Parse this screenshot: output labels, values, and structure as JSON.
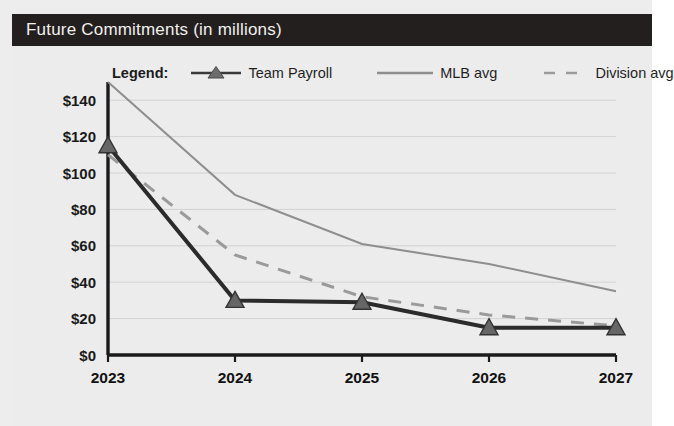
{
  "header": {
    "title": "Future Commitments (in millions)",
    "bar_color": "#231f1e",
    "text_color": "#f2f0ee"
  },
  "panel": {
    "background": "#ececec"
  },
  "legend": {
    "title": "Legend:",
    "entries": [
      {
        "label": "Team Payroll",
        "style": "solid-marker",
        "marker": "triangle",
        "color": "#2b2b2b"
      },
      {
        "label": "MLB avg",
        "style": "solid",
        "marker": "none",
        "color": "#8e8e8e"
      },
      {
        "label": "Division avg",
        "style": "dashed",
        "marker": "none",
        "color": "#9a9a9a"
      }
    ]
  },
  "chart_data": {
    "type": "line",
    "title": "Future Commitments (in millions)",
    "xlabel": "",
    "ylabel": "",
    "categories": [
      "2023",
      "2024",
      "2025",
      "2026",
      "2027"
    ],
    "x": [
      2023,
      2024,
      2025,
      2026,
      2027
    ],
    "series": [
      {
        "name": "Team Payroll",
        "values": [
          115,
          30,
          29,
          15,
          15
        ],
        "color": "#2b2b2b",
        "line_style": "solid",
        "line_width": 4,
        "marker": "triangle"
      },
      {
        "name": "MLB avg",
        "values": [
          150,
          88,
          61,
          50,
          35
        ],
        "color": "#8e8e8e",
        "line_style": "solid",
        "line_width": 2,
        "marker": "none"
      },
      {
        "name": "Division avg",
        "values": [
          110,
          55,
          32,
          22,
          16
        ],
        "color": "#9a9a9a",
        "line_style": "dashed",
        "line_width": 3,
        "marker": "none"
      }
    ],
    "ylim": [
      0,
      150
    ],
    "yticks": [
      0,
      20,
      40,
      60,
      80,
      100,
      120,
      140
    ],
    "ytick_labels": [
      "$0",
      "$20",
      "$40",
      "$60",
      "$80",
      "$100",
      "$120",
      "$140"
    ],
    "grid": true,
    "grid_color": "#d2d2d2",
    "legend_position": "top"
  },
  "axes": {
    "y_tick_labels": [
      "$140",
      "$120",
      "$100",
      "$80",
      "$60",
      "$40",
      "$20",
      "$0"
    ],
    "x_tick_labels": [
      "2023",
      "2024",
      "2025",
      "2026",
      "2027"
    ],
    "axis_color": "#1b1b1b"
  }
}
